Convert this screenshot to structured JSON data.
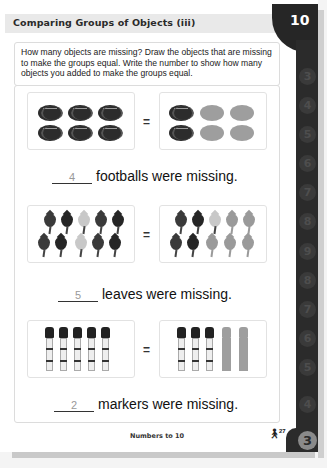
{
  "header": {
    "title": "Comparing Groups of Objects (iii)",
    "tab_number": "10"
  },
  "instructions": "How many objects are missing? Draw the objects that are missing to make the groups equal. Write the number to show how many objects you added to make the groups equal.",
  "side_tabs": [
    "3",
    "4",
    "5",
    "6",
    "7",
    "8",
    "9",
    "8",
    "7",
    "6",
    "5",
    "4",
    "3"
  ],
  "problems": [
    {
      "object": "football-icon",
      "left_group": {
        "count": 6
      },
      "right_group": {
        "drawn": 2,
        "added": 4
      },
      "equals": "=",
      "answer": "4",
      "sentence": "footballs were missing."
    },
    {
      "object": "leaf-icon",
      "left_group": {
        "count": 10
      },
      "right_group": {
        "drawn": 5,
        "added": 5
      },
      "equals": "=",
      "answer": "5",
      "sentence": "leaves were missing."
    },
    {
      "object": "marker-icon",
      "left_group": {
        "count": 5
      },
      "right_group": {
        "drawn": 3,
        "added": 2
      },
      "equals": "=",
      "answer": "2",
      "sentence": "markers were missing."
    }
  ],
  "footer": {
    "section_title": "Numbers to 10",
    "icon": "person-icon",
    "page_number": "27"
  },
  "colors": {
    "tab_dark": "#262626",
    "title_bar": "#e9e9e9",
    "ghost_object": "#9e9e9e",
    "answer_text": "#999999"
  }
}
